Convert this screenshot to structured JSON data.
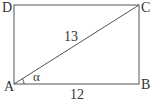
{
  "diagram": {
    "type": "rectangle-with-diagonal",
    "vertices": {
      "A": {
        "label": "A",
        "x": 14,
        "y": 84
      },
      "B": {
        "label": "B",
        "x": 139,
        "y": 84
      },
      "C": {
        "label": "C",
        "x": 139,
        "y": 5
      },
      "D": {
        "label": "D",
        "x": 14,
        "y": 5
      }
    },
    "diagonal": {
      "from": "A",
      "to": "C",
      "label": "13"
    },
    "side_AB": {
      "label": "12"
    },
    "angle": {
      "at": "A",
      "label": "α"
    },
    "stroke_color": "#555555"
  }
}
